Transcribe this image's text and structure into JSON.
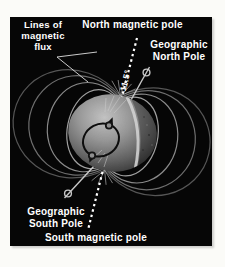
{
  "figure": {
    "type": "earth-magnetic-field-diagram",
    "page_background": "#fbfbf8",
    "panel_background": "#060606"
  },
  "labels": {
    "lines_of_flux": "Lines of\nmagnetic\nflux",
    "north_magnetic_pole": "North magnetic pole",
    "geographic_north_pole": "Geographic\nNorth Pole",
    "tilt_angle": "11.5°",
    "geographic_south_pole": "Geographic\nSouth Pole",
    "south_magnetic_pole": "South magnetic pole"
  },
  "colors": {
    "label_text": "#ffffff",
    "magnetic_axis_dash": "#ffffff",
    "rotation_axis": "#c8c8c8",
    "field_line_inner": "#a0a0a0",
    "field_line_outer": "#565656",
    "globe_light": "#c2c2c2",
    "globe_dark": "#383838",
    "cut_band": "#d0d0d0",
    "dipole_loop": "#0d0d0d"
  }
}
